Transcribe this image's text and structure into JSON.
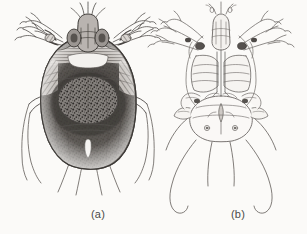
{
  "figure": {
    "background_color": "#fbfaf8",
    "ink_color": "#4a4744",
    "panels": [
      {
        "id": "panel-a",
        "caption": "(a)",
        "view": "dorsal",
        "subject": "mange mite",
        "body_shading": "dense stippled and hatched dark dorsal shield",
        "legs": 8,
        "long_setae": 4
      },
      {
        "id": "panel-b",
        "caption": "(b)",
        "view": "ventral",
        "subject": "mange mite",
        "body_shading": "fine outline with pale unshaded ventral plates",
        "legs": 8,
        "long_setae": 4
      }
    ]
  },
  "captions": {
    "panel_a_label": "(a)",
    "panel_b_label": "(b)"
  },
  "colors": {
    "page": "#fbfaf8",
    "ink": "#4a4744",
    "ink_light": "#8d8a86",
    "ink_dark": "#2b2927",
    "caption": "#4a4a48"
  }
}
